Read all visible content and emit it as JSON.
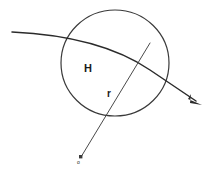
{
  "diagram": {
    "background_color": "#ffffff",
    "stroke_color": "#2b2b2b",
    "circle_stroke_color": "#3a3a3a",
    "labels": {
      "center_region": "H",
      "radius": "r",
      "origin_point": "o"
    },
    "shapes": {
      "circle": {
        "name": "main-circle",
        "cx": 115,
        "cy": 63,
        "r": 53
      },
      "secant": {
        "name": "secant-arrow-line",
        "x1": 12,
        "y1": 32,
        "x2": 202,
        "y2": 104,
        "has_arrowhead": true,
        "arrow_direction": "down-right"
      },
      "radius_line": {
        "name": "radius-line",
        "x1": 150,
        "y1": 43,
        "x2": 81,
        "y2": 158,
        "has_endpoint_dot": true
      }
    }
  }
}
